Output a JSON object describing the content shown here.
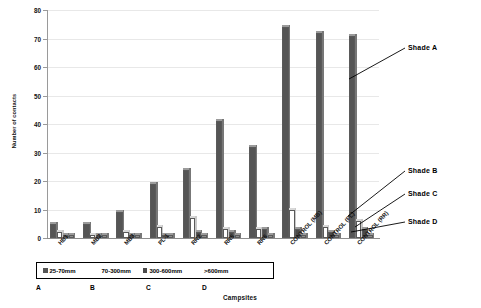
{
  "chart_data": {
    "type": "bar",
    "title": "",
    "xlabel": "Campsites",
    "ylabel": "Number of contacts",
    "ylim": [
      0,
      80
    ],
    "yticks": [
      0,
      10,
      20,
      30,
      40,
      50,
      60,
      70,
      80
    ],
    "grid": true,
    "legend_position": "below-axis",
    "categories": [
      "HB1",
      "MB2",
      "MB3",
      "PL-1",
      "RR2",
      "RR5",
      "RR6",
      "CONTROL (MB)",
      "CONTROL (PL)",
      "CONTROL (RR)"
    ],
    "series": [
      {
        "name": "25-70mm",
        "shade": "Shade A",
        "color": "#555555",
        "values": [
          5,
          5,
          9,
          19,
          24,
          41,
          32,
          74,
          72,
          71
        ]
      },
      {
        "name": "70-300mm",
        "shade": "Shade B",
        "color": "#ffffff",
        "values": [
          2,
          1,
          2,
          4,
          7,
          3,
          3,
          10,
          4,
          6
        ]
      },
      {
        "name": "300-600mm",
        "shade": "Shade C",
        "color": "#4a4a4a",
        "values": [
          1,
          1,
          1,
          1,
          2,
          2,
          3,
          3,
          2,
          3
        ]
      },
      {
        "name": ">600mm",
        "shade": "Shade D",
        "color": "#8c8c8c",
        "values": [
          1,
          1,
          1,
          1,
          1,
          1,
          1,
          1,
          1,
          1
        ]
      }
    ],
    "annotations": [
      {
        "label": "Shade A"
      },
      {
        "label": "Shade B"
      },
      {
        "label": "Shade C"
      },
      {
        "label": "Shade D"
      }
    ],
    "group_letters": [
      "A",
      "B",
      "C",
      "D"
    ]
  },
  "legend": {
    "items": [
      {
        "label": "25-70mm"
      },
      {
        "label": "70-300mm"
      },
      {
        "label": "300-600mm"
      },
      {
        "label": ">600mm"
      }
    ]
  },
  "axes": {
    "y_title": "Number of contacts",
    "x_title": "Campsites",
    "y_ticks": [
      "0",
      "10",
      "20",
      "30",
      "40",
      "50",
      "60",
      "70",
      "80"
    ]
  }
}
